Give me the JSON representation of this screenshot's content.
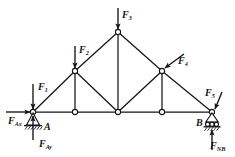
{
  "diagram": {
    "stroke_color": "#141414",
    "node_fill": "#ffffff",
    "loads": [
      {
        "id": "F1",
        "base": "F",
        "sub": "1",
        "x": 38,
        "y": 82,
        "dir": "down",
        "name": "load-f1"
      },
      {
        "id": "F2",
        "base": "F",
        "sub": "2",
        "x": 79,
        "y": 45,
        "dir": "down",
        "name": "load-f2"
      },
      {
        "id": "F3",
        "base": "F",
        "sub": "3",
        "x": 122,
        "y": 10,
        "dir": "down",
        "name": "load-f3"
      },
      {
        "id": "F4",
        "base": "F",
        "sub": "4",
        "x": 178,
        "y": 56,
        "dir": "down-left",
        "name": "load-f4"
      },
      {
        "id": "F5",
        "base": "F",
        "sub": "5",
        "x": 205,
        "y": 88,
        "dir": "down-left",
        "name": "load-f5"
      }
    ],
    "reactions": [
      {
        "id": "FAx",
        "base": "F",
        "sub": "Ax",
        "x": 8,
        "y": 116,
        "dir": "right",
        "name": "reaction-fax"
      },
      {
        "id": "FAy",
        "base": "F",
        "sub": "Ay",
        "x": 39,
        "y": 139,
        "dir": "up",
        "name": "reaction-fay"
      },
      {
        "id": "FNB",
        "base": "F",
        "sub": "NB",
        "x": 210,
        "y": 141,
        "dir": "up",
        "name": "reaction-fnb"
      }
    ],
    "points": [
      {
        "id": "A",
        "label": "A",
        "x": 44,
        "y": 122,
        "name": "point-label-a"
      },
      {
        "id": "B",
        "label": "B",
        "x": 196,
        "y": 118,
        "name": "point-label-b"
      }
    ],
    "supports": [
      {
        "id": "A",
        "type": "pin",
        "x": 33,
        "y": 112,
        "name": "pin-support-a"
      },
      {
        "id": "B",
        "type": "roller",
        "x": 212,
        "y": 112,
        "name": "roller-support-b"
      }
    ],
    "nodes": [
      {
        "id": "n1",
        "x": 33,
        "y": 112,
        "name": "truss-node-a"
      },
      {
        "id": "n2",
        "x": 75,
        "y": 112,
        "name": "truss-node-bottom-1"
      },
      {
        "id": "n3",
        "x": 118,
        "y": 112,
        "name": "truss-node-bottom-mid"
      },
      {
        "id": "n4",
        "x": 162,
        "y": 112,
        "name": "truss-node-bottom-2"
      },
      {
        "id": "n5",
        "x": 212,
        "y": 112,
        "name": "truss-node-b"
      },
      {
        "id": "n6",
        "x": 75,
        "y": 71,
        "name": "truss-node-upper-left"
      },
      {
        "id": "n7",
        "x": 118,
        "y": 32,
        "name": "truss-node-apex"
      },
      {
        "id": "n8",
        "x": 162,
        "y": 71,
        "name": "truss-node-upper-right"
      }
    ],
    "members": [
      {
        "from": "n1",
        "to": "n2",
        "name": "member-bottom-1"
      },
      {
        "from": "n2",
        "to": "n3",
        "name": "member-bottom-2"
      },
      {
        "from": "n3",
        "to": "n4",
        "name": "member-bottom-3"
      },
      {
        "from": "n4",
        "to": "n5",
        "name": "member-bottom-4"
      },
      {
        "from": "n1",
        "to": "n6",
        "name": "member-left-chord-1"
      },
      {
        "from": "n6",
        "to": "n7",
        "name": "member-left-chord-2"
      },
      {
        "from": "n7",
        "to": "n8",
        "name": "member-right-chord-1"
      },
      {
        "from": "n8",
        "to": "n5",
        "name": "member-right-chord-2"
      },
      {
        "from": "n6",
        "to": "n2",
        "name": "member-vertical-left"
      },
      {
        "from": "n7",
        "to": "n3",
        "name": "member-vertical-mid"
      },
      {
        "from": "n8",
        "to": "n4",
        "name": "member-vertical-right"
      },
      {
        "from": "n6",
        "to": "n3",
        "name": "member-diagonal-left"
      },
      {
        "from": "n3",
        "to": "n8",
        "name": "member-diagonal-right"
      }
    ]
  }
}
